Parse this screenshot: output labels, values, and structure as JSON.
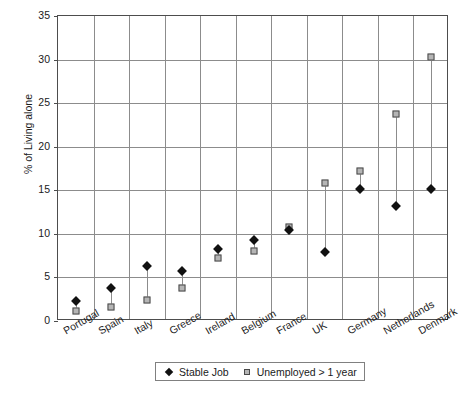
{
  "chart_data": {
    "type": "scatter",
    "title": "",
    "xlabel": "",
    "ylabel": "% of Living alone",
    "ylim": [
      0,
      35
    ],
    "yticks": [
      0,
      5,
      10,
      15,
      20,
      25,
      30,
      35
    ],
    "grid": true,
    "legend_position": "bottom",
    "categories": [
      "Portugal",
      "Spain",
      "Italy",
      "Greece",
      "Ireland",
      "Belgium",
      "France",
      "UK",
      "Germany",
      "Netherlands",
      "Denmark"
    ],
    "series": [
      {
        "name": "Stable Job",
        "marker": "filled-diamond",
        "color": "#111111",
        "values": [
          2.3,
          3.8,
          6.3,
          5.7,
          8.3,
          9.3,
          10.5,
          7.9,
          15.2,
          13.2,
          15.2
        ]
      },
      {
        "name": "Unemployed > 1 year",
        "marker": "open-square",
        "color": "#b5b5b5",
        "values": [
          1.1,
          1.6,
          2.4,
          3.8,
          7.2,
          8.0,
          10.8,
          15.8,
          17.2,
          23.7,
          30.3
        ]
      }
    ]
  }
}
